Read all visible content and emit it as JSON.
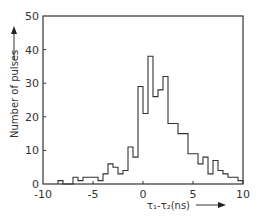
{
  "chart_data": {
    "type": "bar",
    "subtype": "histogram",
    "title": "",
    "xlabel": "τ1-τ2(ns)",
    "ylabel": "Number of pulses",
    "xlim": [
      -10,
      10
    ],
    "ylim": [
      0,
      50
    ],
    "xticks": [
      -10,
      -5,
      0,
      5,
      10
    ],
    "yticks": [
      0,
      10,
      20,
      30,
      40,
      50
    ],
    "xtick_labels": [
      "-10",
      "-5",
      "0",
      "5",
      "10"
    ],
    "ytick_labels": [
      "0",
      "10",
      "20",
      "30",
      "40",
      "50"
    ],
    "grid": false,
    "legend": null,
    "bin_width": 0.5,
    "bins": [
      {
        "x0": -8.5,
        "count": 1
      },
      {
        "x0": -8.0,
        "count": 0
      },
      {
        "x0": -7.5,
        "count": 0
      },
      {
        "x0": -7.0,
        "count": 2
      },
      {
        "x0": -6.5,
        "count": 1
      },
      {
        "x0": -6.0,
        "count": 2
      },
      {
        "x0": -5.5,
        "count": 2
      },
      {
        "x0": -5.0,
        "count": 2
      },
      {
        "x0": -4.5,
        "count": 1
      },
      {
        "x0": -4.0,
        "count": 3
      },
      {
        "x0": -3.5,
        "count": 6
      },
      {
        "x0": -3.0,
        "count": 5
      },
      {
        "x0": -2.5,
        "count": 3
      },
      {
        "x0": -2.0,
        "count": 4
      },
      {
        "x0": -1.5,
        "count": 11
      },
      {
        "x0": -1.0,
        "count": 8
      },
      {
        "x0": -0.5,
        "count": 29
      },
      {
        "x0": 0.0,
        "count": 21
      },
      {
        "x0": 0.5,
        "count": 38
      },
      {
        "x0": 1.0,
        "count": 26
      },
      {
        "x0": 1.5,
        "count": 28
      },
      {
        "x0": 2.0,
        "count": 32
      },
      {
        "x0": 2.5,
        "count": 18
      },
      {
        "x0": 3.0,
        "count": 18
      },
      {
        "x0": 3.5,
        "count": 15
      },
      {
        "x0": 4.0,
        "count": 15
      },
      {
        "x0": 4.5,
        "count": 9
      },
      {
        "x0": 5.0,
        "count": 9
      },
      {
        "x0": 5.5,
        "count": 6
      },
      {
        "x0": 6.0,
        "count": 8
      },
      {
        "x0": 6.5,
        "count": 3
      },
      {
        "x0": 7.0,
        "count": 7
      },
      {
        "x0": 7.5,
        "count": 4
      },
      {
        "x0": 8.0,
        "count": 3
      },
      {
        "x0": 8.5,
        "count": 2
      },
      {
        "x0": 9.0,
        "count": 2
      },
      {
        "x0": 9.5,
        "count": 1
      }
    ]
  },
  "labels": {
    "y_axis": "Number of pulses",
    "x_axis": "τ₁-τ₂(ns)"
  }
}
